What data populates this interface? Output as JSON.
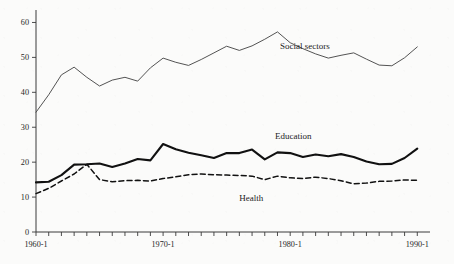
{
  "chart_data": {
    "type": "line",
    "title": "",
    "subtitle": "",
    "xlabel": "",
    "ylabel": "",
    "xlim": [
      1960,
      1991
    ],
    "ylim": [
      0,
      63
    ],
    "yticks": [
      0,
      10,
      20,
      30,
      40,
      50,
      60
    ],
    "ytick_labels": [
      "0",
      "10",
      "20",
      "30",
      "40",
      "50",
      "60"
    ],
    "x": [
      1960,
      1961,
      1962,
      1963,
      1964,
      1965,
      1966,
      1967,
      1968,
      1969,
      1970,
      1971,
      1972,
      1973,
      1974,
      1975,
      1976,
      1977,
      1978,
      1979,
      1980,
      1981,
      1982,
      1983,
      1984,
      1985,
      1986,
      1987,
      1988,
      1989,
      1990
    ],
    "xtick_labels": [
      "1960-1",
      "1970-1",
      "1980-1",
      "1990-1"
    ],
    "xtick_label_positions": [
      1960,
      1970,
      1980,
      1990
    ],
    "xtick_count": 31,
    "grid": false,
    "legend_position": "inline-annotations",
    "series": [
      {
        "name": "Social sectors",
        "style": "solid-thin",
        "color": "#4a4a4a",
        "label_x": 1979.2,
        "label_y": 52.5,
        "values": [
          34.3,
          39.3,
          45.0,
          47.2,
          44.3,
          41.8,
          43.5,
          44.3,
          43.2,
          47.0,
          49.8,
          48.6,
          47.7,
          49.4,
          51.3,
          53.2,
          52.0,
          53.3,
          55.2,
          57.3,
          54.2,
          52.5,
          51.0,
          49.8,
          50.6,
          51.3,
          49.5,
          47.8,
          47.6,
          49.9,
          53.0
        ]
      },
      {
        "name": "Education",
        "style": "solid-thick",
        "color": "#111111",
        "label_x": 1978.8,
        "label_y": 26.6,
        "values": [
          14.2,
          14.4,
          16.3,
          19.3,
          19.4,
          19.6,
          18.6,
          19.6,
          20.9,
          20.5,
          25.2,
          23.7,
          22.7,
          22.0,
          21.2,
          22.6,
          22.6,
          23.6,
          20.8,
          22.8,
          22.6,
          21.5,
          22.2,
          21.7,
          22.3,
          21.5,
          20.2,
          19.4,
          19.5,
          21.2,
          23.9
        ]
      },
      {
        "name": "Health",
        "style": "dashed",
        "color": "#111111",
        "label_x": 1976.0,
        "label_y": 8.8,
        "values": [
          11.0,
          12.5,
          14.6,
          16.6,
          19.4,
          15.0,
          14.4,
          14.7,
          14.8,
          14.6,
          15.3,
          15.8,
          16.4,
          16.6,
          16.4,
          16.3,
          16.2,
          16.0,
          15.0,
          16.0,
          15.5,
          15.3,
          15.7,
          15.3,
          14.7,
          13.8,
          14.0,
          14.5,
          14.6,
          14.9,
          14.8
        ]
      }
    ]
  }
}
